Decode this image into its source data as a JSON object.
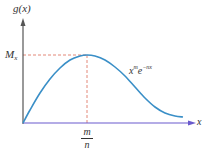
{
  "chart_data": {
    "type": "line",
    "title": "",
    "xlabel": "x",
    "ylabel": "g(x)",
    "curve_label": {
      "base": "x",
      "exp1": "m",
      "mid": "e",
      "exp2": "−nx"
    },
    "peak": {
      "x_label_num": "m",
      "x_label_den": "n",
      "y_label_main": "M",
      "y_label_sub": "x"
    },
    "series": [
      {
        "name": "x^m e^{-nx}",
        "color": "#3a8fc7",
        "points_px": [
          [
            23,
            123
          ],
          [
            30,
            110
          ],
          [
            40,
            93
          ],
          [
            50,
            79
          ],
          [
            60,
            68
          ],
          [
            70,
            60
          ],
          [
            80,
            56
          ],
          [
            87,
            55
          ],
          [
            95,
            56
          ],
          [
            105,
            60
          ],
          [
            115,
            67
          ],
          [
            125,
            76
          ],
          [
            135,
            87
          ],
          [
            145,
            98
          ],
          [
            155,
            107
          ],
          [
            165,
            113
          ],
          [
            175,
            116
          ],
          [
            183,
            117
          ]
        ]
      }
    ],
    "grid": false,
    "legend": "none",
    "colors": {
      "axis_y": "#555555",
      "axis_x": "#6a5acd",
      "dash": "#e07a6a",
      "curve": "#3a8fc7"
    }
  }
}
